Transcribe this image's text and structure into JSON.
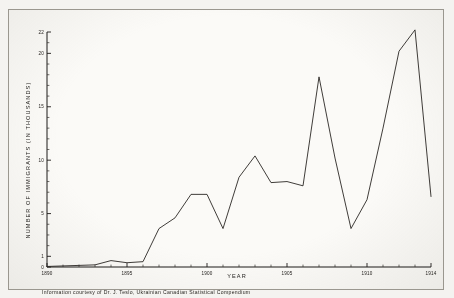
{
  "figure": {
    "background_color": "#fbfaf7",
    "ink_color": "#2a2724",
    "frame_color": "#9a978f",
    "footnote": "Information courtesy of Dr. J. Teslo, Ukrainian Canadian Statistical Compendium"
  },
  "chart_data": {
    "type": "line",
    "title": "",
    "xlabel": "YEAR",
    "ylabel": "NUMBER OF IMMIGRANTS (IN THOUSANDS)",
    "xlim": [
      1890,
      1914
    ],
    "ylim": [
      0,
      22
    ],
    "grid": false,
    "legend": null,
    "x_tick_labels": [
      "1890",
      "1895",
      "1900",
      "1905",
      "1910",
      "1914"
    ],
    "x_ticks": [
      1890,
      1895,
      1900,
      1905,
      1910,
      1914
    ],
    "x_minor_tick_step": 1,
    "y_tick_labels": [
      "0",
      "1",
      "5",
      "10",
      "15",
      "20",
      "22"
    ],
    "y_ticks": [
      0,
      1,
      5,
      10,
      15,
      20,
      22
    ],
    "y_minor_tick_step": 1,
    "x": [
      1890,
      1891,
      1892,
      1893,
      1894,
      1895,
      1896,
      1897,
      1898,
      1899,
      1900,
      1901,
      1902,
      1903,
      1904,
      1905,
      1906,
      1907,
      1908,
      1909,
      1910,
      1911,
      1912,
      1913,
      1914
    ],
    "values": [
      0.05,
      0.1,
      0.15,
      0.2,
      0.6,
      0.4,
      0.5,
      3.6,
      4.6,
      6.8,
      6.8,
      3.6,
      8.4,
      10.4,
      7.9,
      8.0,
      7.6,
      17.8,
      10.2,
      3.6,
      6.3,
      13.0,
      20.2,
      22.2,
      6.6
    ],
    "series": [
      {
        "name": "Ukrainian immigrants to Canada",
        "values": [
          0.05,
          0.1,
          0.15,
          0.2,
          0.6,
          0.4,
          0.5,
          3.6,
          4.6,
          6.8,
          6.8,
          3.6,
          8.4,
          10.4,
          7.9,
          8.0,
          7.6,
          17.8,
          10.2,
          3.6,
          6.3,
          13.0,
          20.2,
          22.2,
          6.6
        ]
      }
    ]
  }
}
